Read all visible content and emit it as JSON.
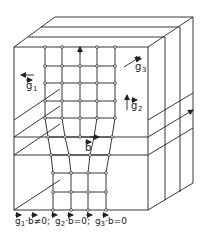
{
  "diagram": {
    "type": "3d-crystal-block-with-dislocation",
    "vectors": {
      "g1": {
        "base": "g",
        "sub": "1"
      },
      "g2": {
        "base": "g",
        "sub": "2"
      },
      "g3": {
        "base": "g",
        "sub": "3"
      },
      "b": {
        "base": "b"
      }
    },
    "caption": {
      "part1": {
        "base": "g",
        "sub": "1",
        "rest": "·b≠0;"
      },
      "part2": {
        "base": "g",
        "sub": "2",
        "rest": "·b=0;"
      },
      "part3": {
        "base": "g",
        "sub": "3",
        "rest": "·b=0"
      }
    },
    "colors": {
      "line": "#222222",
      "background": "#ffffff"
    }
  }
}
